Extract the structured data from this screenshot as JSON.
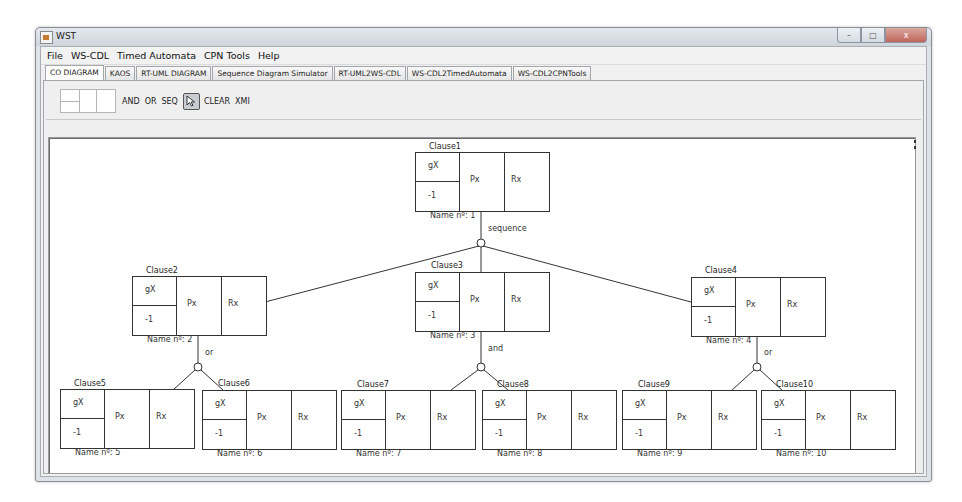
{
  "window": {
    "title": "WST",
    "controls": {
      "minimize": "–",
      "maximize": "□",
      "close": "x"
    }
  },
  "menu": [
    "File",
    "WS-CDL",
    "Timed Automata",
    "CPN Tools",
    "Help"
  ],
  "tabs": [
    {
      "label": "CO DIAGRAM",
      "active": true
    },
    {
      "label": "KAOS",
      "active": false
    },
    {
      "label": "RT-UML DIAGRAM",
      "active": false
    },
    {
      "label": "Sequence Diagram Simulator",
      "active": false
    },
    {
      "label": "RT-UML2WS-CDL",
      "active": false
    },
    {
      "label": "WS-CDL2TimedAutomata",
      "active": false
    },
    {
      "label": "WS-CDL2CPNTools",
      "active": false
    }
  ],
  "toolbar": {
    "and_label": "AND",
    "or_label": "OR",
    "seq_label": "SEQ",
    "select_icon": "cursor-arrow-icon",
    "clear_label": "CLEAR",
    "xmi_label": "XMI"
  },
  "diagram": {
    "clauses": [
      {
        "title": "Clause1",
        "g": "gX",
        "t": "-1",
        "p": "Px",
        "r": "Rx",
        "name": "Name nº: 1"
      },
      {
        "title": "Clause2",
        "g": "gX",
        "t": "-1",
        "p": "Px",
        "r": "Rx",
        "name": "Name nº: 2"
      },
      {
        "title": "Clause3",
        "g": "gX",
        "t": "-1",
        "p": "Px",
        "r": "Rx",
        "name": "Name nº: 3"
      },
      {
        "title": "Clause4",
        "g": "gX",
        "t": "-1",
        "p": "Px",
        "r": "Rx",
        "name": "Name nº: 4"
      },
      {
        "title": "Clause5",
        "g": "gX",
        "t": "-1",
        "p": "Px",
        "r": "Rx",
        "name": "Name nº: 5"
      },
      {
        "title": "Clause6",
        "g": "gX",
        "t": "-1",
        "p": "Px",
        "r": "Rx",
        "name": "Name nº: 6"
      },
      {
        "title": "Clause7",
        "g": "gX",
        "t": "-1",
        "p": "Px",
        "r": "Rx",
        "name": "Name nº: 7"
      },
      {
        "title": "Clause8",
        "g": "gX",
        "t": "-1",
        "p": "Px",
        "r": "Rx",
        "name": "Name nº: 8"
      },
      {
        "title": "Clause9",
        "g": "gX",
        "t": "-1",
        "p": "Px",
        "r": "Rx",
        "name": "Name nº: 9"
      },
      {
        "title": "Clause10",
        "g": "gX",
        "t": "-1",
        "p": "Px",
        "r": "Rx",
        "name": "Name nº: 10"
      }
    ],
    "operators": [
      {
        "label": "sequence",
        "parent": "Clause1"
      },
      {
        "label": "or",
        "parent": "Clause2"
      },
      {
        "label": "and",
        "parent": "Clause3"
      },
      {
        "label": "or",
        "parent": "Clause4"
      }
    ]
  }
}
